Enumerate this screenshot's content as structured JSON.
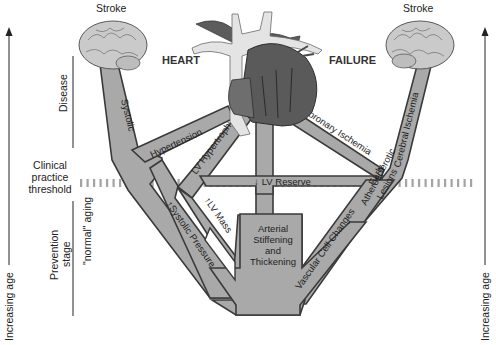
{
  "diagram": {
    "title_left": "HEART",
    "title_right": "FAILURE",
    "endpoints": {
      "left_brain_label": "Stroke",
      "right_brain_label": "Stroke"
    },
    "axes": {
      "left_axis_label": "Increasing age",
      "right_axis_label": "Increasing age"
    },
    "stages": {
      "disease": "Disease",
      "threshold_line1": "Clinical",
      "threshold_line2": "practice",
      "threshold_line3": "threshold",
      "prevention_line1": "Prevention",
      "prevention_line2": "stage",
      "normal_aging": "\"normal\" aging"
    },
    "bands": {
      "systolic": "Systolic",
      "hypertension": "Hypertension",
      "lv_hypertrophy": "LV Hypertrophy",
      "lv_reserve": "LV Reserve",
      "lv_mass": "LV Mass",
      "systolic_pressure": "Systolic Pressure",
      "coronary_ischemia": "Coronary Ischemia",
      "cerebral_ischemia": "Cerebral Ischemia",
      "early_lesions_line1": "Early",
      "early_lesions_line2": "Atherosclerotic",
      "early_lesions_line3": "Lesions",
      "vascular_cell_changes": "Vascular Cell Changes",
      "arterial_line1": "Arterial",
      "arterial_line2": "Stiffening",
      "arterial_line3": "and",
      "arterial_line4": "Thickening"
    },
    "arrows": {
      "lv_reserve": "down",
      "lv_mass": "up",
      "systolic_pressure": "up"
    },
    "colors": {
      "band_fill": "#a9a9a9",
      "band_stroke": "#3a3a3a",
      "threshold_dash": "#9a9a9a",
      "brain": "#c8c8c8",
      "heart_dark": "#5a5a5a",
      "vessel_light": "#e6e6e6"
    }
  }
}
